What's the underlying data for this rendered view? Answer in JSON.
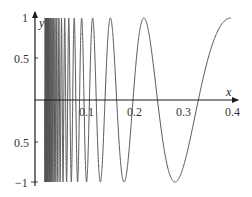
{
  "chart_data": {
    "type": "line",
    "title": "",
    "function": "y = sin(pi / x)",
    "xlabel": "x",
    "ylabel": "y",
    "xlim": [
      0,
      0.4
    ],
    "ylim": [
      -1,
      1
    ],
    "x_ticks": [
      "0.1",
      "0.2",
      "0.3",
      "0.4"
    ],
    "y_ticks": [
      "1",
      "0.5",
      "0.5",
      "−1"
    ],
    "x_domain_start": 0.02,
    "grid": false,
    "legend": null,
    "series": [
      {
        "name": "sin(π/x)",
        "color": "#555555",
        "x": [
          0.02,
          0.05,
          0.1,
          0.137,
          0.157,
          0.188,
          0.227,
          0.292,
          0.333,
          0.4
        ],
        "y": [
          0.0,
          0.0,
          0.0,
          -1,
          1,
          -1,
          1,
          -1,
          0,
          1
        ]
      }
    ],
    "extrema": {
      "maxima_x": [
        0.157,
        0.227,
        0.4
      ],
      "minima_x": [
        0.137,
        0.188,
        0.292
      ]
    }
  },
  "labels": {
    "x_axis": "x",
    "y_axis": "y",
    "tick_x_1": "0.1",
    "tick_x_2": "0.2",
    "tick_x_3": "0.3",
    "tick_x_4": "0.4",
    "tick_y_top": "1",
    "tick_y_half": "0.5",
    "tick_y_neg_half": "0.5",
    "tick_y_bottom": "−1"
  },
  "colors": {
    "axis": "#1a1a1a",
    "curve": "#555555"
  }
}
